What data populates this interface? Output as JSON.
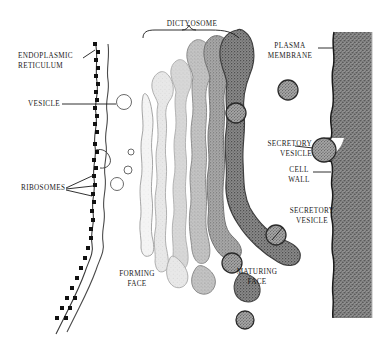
{
  "figure": {
    "background_color": "#ffffff",
    "ink_color": "#1a1a1a"
  },
  "labels": {
    "endoplasmic_reticulum": "ENDOPLASMIC\nRETICULUM",
    "vesicle": "VESICLE",
    "ribosomes": "RIBOSOMES",
    "forming_face": "FORMING\nFACE",
    "dictyosome": "DICTYOSOME",
    "maturing_face": "MATURING\nFACE",
    "plasma_membrane": "PLASMA\nMEMBRANE",
    "secretory_vesicle_upper": "SECRETORY\nVESICLE",
    "cell_wall": "CELL\nWALL",
    "secretory_vesicle_lower": "SECRETORY\nVESICLE"
  },
  "structures": {
    "endoplasmic_reticulum": {
      "name": "rough endoplasmic reticulum",
      "description": "two wavy parallel membrane lines running top to bottom-left",
      "ribosome_count": 24,
      "ribosome_shape": "small black square",
      "stroke_color": "#303030"
    },
    "transition_vesicles": {
      "count": 4,
      "fill": "none",
      "stroke": "#555555",
      "description": "small open circles budding from ER toward forming face"
    },
    "dictyosome": {
      "cisterna_count": 6,
      "description": "stack of curved flattened cisternae, palest at forming face, darkest at maturing face",
      "cisterna_fills": [
        "#f2f2f2",
        "#e4e4e4",
        "#d2d2d2",
        "#bdbdbd",
        "#9e9e9e",
        "#7a7a7a"
      ],
      "forming_face_side": "left",
      "maturing_face_side": "right"
    },
    "secretory_vesicles": {
      "count": 6,
      "fill": "#9c9c9c",
      "stroke": "#2a2a2a",
      "description": "stippled gray spheres released from maturing face moving toward plasma membrane"
    },
    "plasma_membrane": {
      "description": "dark line on inner face of cell wall",
      "stroke": "#1a1a1a"
    },
    "cell_wall": {
      "description": "thick stippled vertical band at right edge with fusing vesicle bulges",
      "fill": "#8e8e8e"
    }
  }
}
